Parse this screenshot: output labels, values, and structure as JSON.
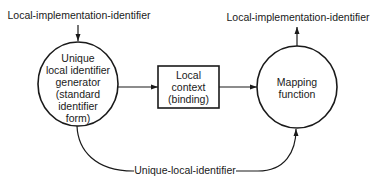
{
  "diagram": {
    "top_left_label": "Local-implementation-identifier",
    "top_right_label": "Local-implementation-identifier",
    "generator_node": {
      "lines": [
        "Unique",
        "local identifier",
        "generator",
        "(standard",
        "identifier",
        "form)"
      ]
    },
    "context_node": {
      "lines": [
        "Local",
        "context",
        "(binding)"
      ]
    },
    "mapping_node": {
      "lines": [
        "Mapping",
        "function"
      ]
    },
    "bottom_label": "Unique-local-identifier",
    "colors": {
      "ink": "#1a1a1a",
      "background": "#ffffff"
    }
  }
}
